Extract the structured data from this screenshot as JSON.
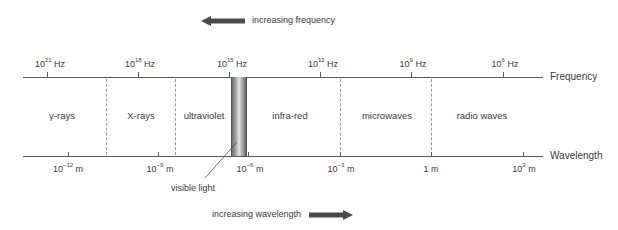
{
  "diagram": {
    "top_arrow": {
      "label": "increasing frequency",
      "direction": "left"
    },
    "bottom_arrow": {
      "label": "increasing wavelength",
      "direction": "right"
    },
    "frequency_axis": {
      "label": "Frequency",
      "ticks": [
        {
          "base": "10",
          "exp": "21",
          "unit": "Hz"
        },
        {
          "base": "10",
          "exp": "18",
          "unit": "Hz"
        },
        {
          "base": "10",
          "exp": "15",
          "unit": "Hz"
        },
        {
          "base": "10",
          "exp": "12",
          "unit": "Hz"
        },
        {
          "base": "10",
          "exp": "9",
          "unit": "Hz"
        },
        {
          "base": "10",
          "exp": "6",
          "unit": "Hz"
        }
      ]
    },
    "wavelength_axis": {
      "label": "Wavelength",
      "ticks": [
        {
          "base": "10",
          "exp": "−12",
          "unit": "m"
        },
        {
          "base": "10",
          "exp": "−9",
          "unit": "m"
        },
        {
          "base": "10",
          "exp": "−6",
          "unit": "m"
        },
        {
          "base": "10",
          "exp": "−3",
          "unit": "m"
        },
        {
          "base": "1",
          "exp": "",
          "unit": "m"
        },
        {
          "base": "10",
          "exp": "3",
          "unit": "m"
        }
      ]
    },
    "regions": [
      {
        "label": "γ-rays"
      },
      {
        "label": "X-rays"
      },
      {
        "label": "ultraviolet"
      },
      {
        "label": "infra-red"
      },
      {
        "label": "microwaves"
      },
      {
        "label": "radio waves"
      }
    ],
    "visible_light": {
      "label": "visible light"
    },
    "colors": {
      "line": "#5a5a5a",
      "arrow": "#4a4a4a",
      "dashed": "#9a9a9a",
      "text": "#3a3a3a"
    }
  }
}
